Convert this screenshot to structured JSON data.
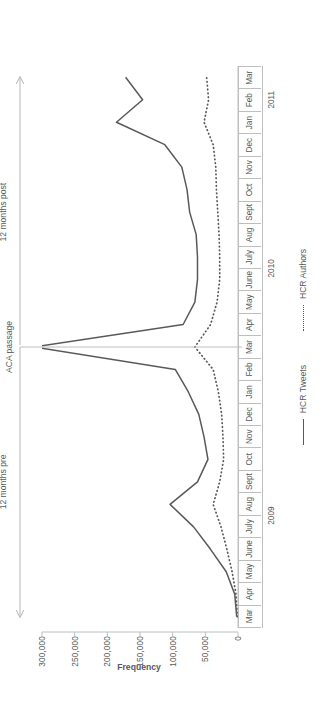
{
  "figure": {
    "orientation": "rotated-90-ccw",
    "background": "#ffffff",
    "ink_color": "#58595b",
    "axis_color": "#bcbec0"
  },
  "annotations": {
    "pre_label": "12 months pre",
    "event_label": "ACA passage",
    "post_label": "12 months post"
  },
  "legend": {
    "items": [
      {
        "label": "HCR Tweets",
        "style": "solid",
        "color": "#58595b"
      },
      {
        "label": "HCR Authors",
        "style": "dotted",
        "color": "#58595b"
      }
    ]
  },
  "axis": {
    "y_title": "Frequency",
    "y_ticks": [
      "0",
      "50,000",
      "100,000",
      "150,000",
      "200,000",
      "250,000",
      "300,000"
    ],
    "year_groups": [
      {
        "label": "2009",
        "start_index": 0,
        "count": 10
      },
      {
        "label": "2010",
        "start_index": 10,
        "count": 12
      },
      {
        "label": "2011",
        "start_index": 22,
        "count": 3
      }
    ]
  },
  "chart_data": {
    "type": "line",
    "title": "",
    "subtitle": "",
    "xlabel": "",
    "ylabel": "Frequency",
    "ylim": [
      0,
      300000
    ],
    "grid": false,
    "legend_position": "bottom",
    "categories": [
      "Mar",
      "Apr",
      "May",
      "June",
      "July",
      "Aug",
      "Sept",
      "Oct",
      "Nov",
      "Dec",
      "Jan",
      "Feb",
      "Mar",
      "Apr",
      "May",
      "June",
      "July",
      "Aug",
      "Sept",
      "Oct",
      "Nov",
      "Dec",
      "Jan",
      "Feb",
      "Mar"
    ],
    "category_years": [
      "2009",
      "2009",
      "2009",
      "2009",
      "2009",
      "2009",
      "2009",
      "2009",
      "2009",
      "2009",
      "2010",
      "2010",
      "2010",
      "2010",
      "2010",
      "2010",
      "2010",
      "2010",
      "2010",
      "2010",
      "2010",
      "2010",
      "2011",
      "2011",
      "2011"
    ],
    "ytick_values": [
      0,
      50000,
      100000,
      150000,
      200000,
      250000,
      300000
    ],
    "event_marker": {
      "label": "ACA passage",
      "category": "Mar",
      "category_index": 12
    },
    "spans": [
      {
        "label": "12 months pre",
        "start_index": 0,
        "end_index": 12
      },
      {
        "label": "12 months post",
        "start_index": 12,
        "end_index": 24
      }
    ],
    "series": [
      {
        "name": "HCR Tweets",
        "style": "solid",
        "color": "#58595b",
        "values": [
          2000,
          5000,
          18000,
          42000,
          68000,
          104000,
          62000,
          46000,
          52000,
          60000,
          76000,
          96000,
          312000,
          84000,
          66000,
          62000,
          62000,
          64000,
          74000,
          78000,
          86000,
          112000,
          186000,
          146000,
          172000
        ]
      },
      {
        "name": "HCR Authors",
        "style": "dotted",
        "color": "#58595b",
        "values": [
          1200,
          3000,
          9000,
          17000,
          26000,
          38000,
          28000,
          22000,
          23000,
          25000,
          30000,
          38000,
          66000,
          42000,
          32000,
          28000,
          28000,
          29000,
          31000,
          33000,
          34000,
          38000,
          52000,
          45000,
          48000
        ]
      }
    ]
  }
}
